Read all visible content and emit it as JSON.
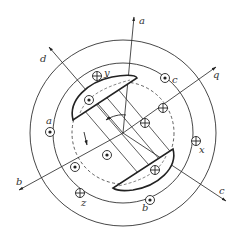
{
  "diagram": {
    "title": "",
    "center": [
      123,
      133
    ],
    "circles": {
      "outer_r": 93,
      "stator_inner_r": 70,
      "rotor_dashed_r": 51
    },
    "axes": [
      {
        "label": "a",
        "from": [
          123,
          133
        ],
        "to": [
          134,
          17
        ],
        "label_pos": [
          139,
          24
        ]
      },
      {
        "label": "d",
        "from": [
          123,
          133
        ],
        "to": [
          49,
          47
        ],
        "label_pos": [
          40,
          60
        ]
      },
      {
        "label": "q",
        "from": [
          123,
          133
        ],
        "to": [
          216,
          67
        ],
        "label_pos": [
          213,
          78
        ]
      },
      {
        "label": "b",
        "from": [
          123,
          133
        ],
        "to": [
          19,
          190
        ],
        "label_pos": [
          16,
          184
        ]
      },
      {
        "label": "c",
        "from": [
          123,
          133
        ],
        "to": [
          226,
          201
        ],
        "label_pos": [
          219,
          197
        ]
      }
    ],
    "stator_conductors": [
      {
        "label": "y",
        "symbol": "cross",
        "pos": [
          97,
          76
        ],
        "label_pos": [
          104,
          76
        ]
      },
      {
        "label": "c",
        "symbol": "dot",
        "pos": [
          165,
          78
        ],
        "label_pos": [
          172,
          83
        ]
      },
      {
        "label": "a",
        "symbol": "dot",
        "pos": [
          50,
          132
        ],
        "label_pos": [
          46,
          124
        ]
      },
      {
        "label": "x",
        "symbol": "cross",
        "pos": [
          196,
          141
        ],
        "label_pos": [
          199,
          153
        ]
      },
      {
        "label": "z",
        "symbol": "cross",
        "pos": [
          80,
          193
        ],
        "label_pos": [
          82,
          206
        ]
      },
      {
        "label": "b",
        "symbol": "dot",
        "pos": [
          150,
          200
        ],
        "label_pos": [
          143,
          211
        ]
      }
    ],
    "rotor_conductors": [
      {
        "symbol": "dot",
        "pos": [
          89,
          100
        ]
      },
      {
        "symbol": "cross",
        "pos": [
          163,
          108
        ]
      },
      {
        "symbol": "cross",
        "pos": [
          145,
          123
        ]
      },
      {
        "symbol": "dot",
        "pos": [
          107,
          155
        ]
      },
      {
        "symbol": "dot",
        "pos": [
          75,
          167
        ]
      },
      {
        "symbol": "cross",
        "pos": [
          155,
          170
        ]
      }
    ],
    "pole_shoes": [
      {
        "name": "north-pole-shoe"
      },
      {
        "name": "south-pole-shoe"
      }
    ],
    "rotation_arrow": {
      "pos": [
        86,
        140
      ]
    },
    "angle_arc": {
      "pos": [
        118,
        117
      ]
    }
  }
}
